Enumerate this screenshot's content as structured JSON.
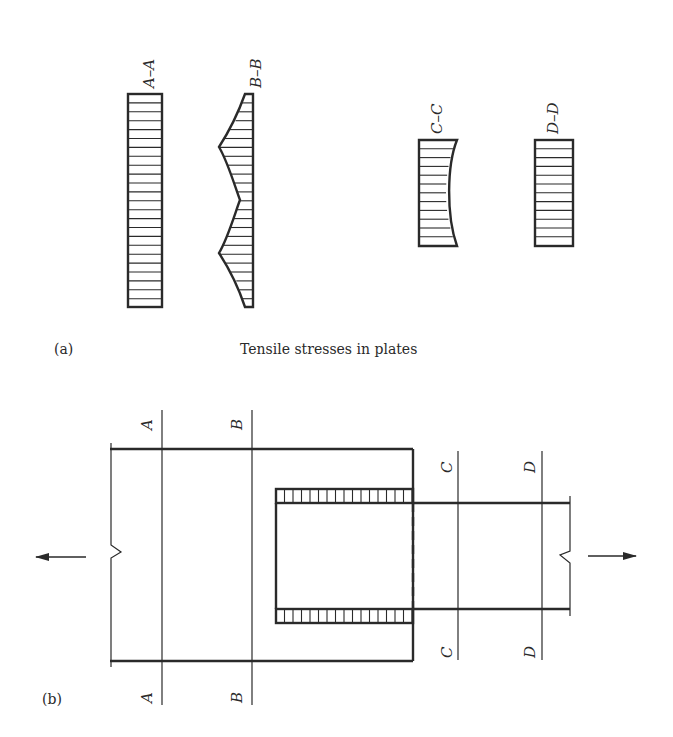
{
  "figure": {
    "part_a": {
      "label": "(a)",
      "caption": "Tensile stresses in plates",
      "sections": [
        {
          "id": "A-A",
          "label": "A–A",
          "distribution": "uniform"
        },
        {
          "id": "B-B",
          "label": "B–B",
          "distribution": "peaked near fasteners"
        },
        {
          "id": "C-C",
          "label": "C–C",
          "distribution": "concave, reduced at center"
        },
        {
          "id": "D-D",
          "label": "D–D",
          "distribution": "uniform"
        }
      ]
    },
    "part_b": {
      "label": "(b)",
      "section_marks": {
        "A_top": "A",
        "A_bottom": "A",
        "B_top": "B",
        "B_bottom": "B",
        "C_top": "C",
        "C_bottom": "C",
        "D_top": "D",
        "D_bottom": "D"
      },
      "left_arrow": "tension-left",
      "right_arrow": "tension-right"
    }
  }
}
